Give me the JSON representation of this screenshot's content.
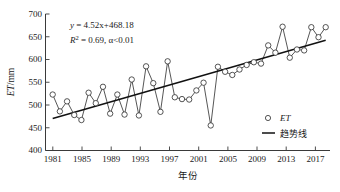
{
  "chart_data": {
    "type": "line",
    "title": "",
    "xlabel": "年份",
    "ylabel": "ET/mm",
    "ylabel_parts": {
      "italic": "ET",
      "rest": "/mm"
    },
    "xlim": [
      1980,
      2019.6
    ],
    "ylim": [
      400,
      700
    ],
    "ytick_step": 50,
    "xtick_step": 4,
    "grid": false,
    "yticks": [
      400,
      450,
      500,
      550,
      600,
      650,
      700
    ],
    "xticks": [
      1981,
      1985,
      1989,
      1993,
      1997,
      2001,
      2005,
      2009,
      2013,
      2017
    ],
    "xtick_labels": [
      "1981",
      "1985",
      "1989",
      "1993",
      "1997",
      "2001",
      "2005",
      "2009",
      "2013",
      "2017"
    ],
    "ytick_labels": [
      "400",
      "450",
      "500",
      "550",
      "600",
      "650",
      "700"
    ],
    "x": [
      1981,
      1982,
      1983,
      1984,
      1985,
      1986,
      1987,
      1988,
      1989,
      1990,
      1991,
      1992,
      1993,
      1994,
      1995,
      1996,
      1997,
      1998,
      1999,
      2000,
      2001,
      2002,
      2003,
      2004,
      2005,
      2006,
      2007,
      2008,
      2009,
      2010,
      2011,
      2012,
      2013,
      2014,
      2015,
      2016,
      2017,
      2018,
      2019
    ],
    "series": [
      {
        "name": "ET",
        "marker": "open-circle",
        "values": [
          523,
          486,
          508,
          478,
          467,
          527,
          504,
          540,
          481,
          523,
          479,
          556,
          477,
          585,
          548,
          485,
          596,
          517,
          513,
          512,
          532,
          549,
          455,
          584,
          573,
          566,
          578,
          588,
          594,
          591,
          631,
          615,
          672,
          604,
          622,
          620,
          671,
          649,
          671
        ]
      },
      {
        "name": "趋势线",
        "type": "trend",
        "equation_slope": 4.52,
        "equation_intercept": 468.18,
        "y_start": 470.4,
        "y_end": 642.2
      }
    ],
    "annotations": [
      {
        "id": "regression-equation",
        "text": "y = 4.52x+468.18",
        "italic_var": "y",
        "x": 1984.4,
        "y": 676
      },
      {
        "id": "r-squared",
        "text": "R2 = 0.69, α<0.01",
        "display": "R² = 0.69, α<0.01",
        "x": 1984.4,
        "y": 653
      }
    ],
    "legend": {
      "position": "lower-right",
      "entries": [
        {
          "label": "ET",
          "marker": "open-circle",
          "italic": true
        },
        {
          "label": "趋势线",
          "marker": "line",
          "italic": false
        }
      ]
    },
    "colors": {
      "marker_edge": "#2b2b2b",
      "marker_fill": "#ffffff",
      "series_line": "#2b2b2b",
      "trend_line": "#111111",
      "axis": "#3a3a3a",
      "text": "#1a1a1a",
      "background": "#ffffff"
    }
  },
  "annotation_text": {
    "equation_y": "y",
    "equation_rest": " = 4.52x+468.18",
    "r_symbol": "R",
    "r_sup": "2",
    "r_rest": " = 0.69, α<0.01"
  },
  "axis_labels": {
    "y_italic": "ET",
    "y_rest": "/mm",
    "x_title": "年份"
  },
  "legend_labels": {
    "et": "ET",
    "trend": "趋势线"
  }
}
